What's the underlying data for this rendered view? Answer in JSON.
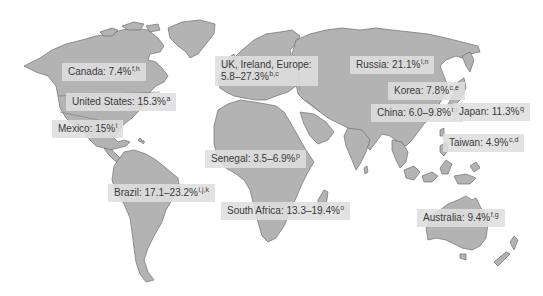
{
  "map": {
    "type": "world-map",
    "land_color": "#b3b3b3",
    "outline_color": "#6e6e6e",
    "label_bg": "#dedede",
    "text_color": "#3a3a3a"
  },
  "labels": [
    {
      "id": "canada",
      "text": "Canada: 7.4%",
      "sup": "f,h"
    },
    {
      "id": "united-states",
      "text": "United States: 15.3%",
      "sup": "a"
    },
    {
      "id": "mexico",
      "text": "Mexico: 15%",
      "sup": "i"
    },
    {
      "id": "uk-europe",
      "text": "UK, Ireland, Europe:",
      "text2": "5.8–27.3%",
      "sup": "b,c"
    },
    {
      "id": "russia",
      "text": "Russia: 21.1%",
      "sup": "l,n"
    },
    {
      "id": "korea",
      "text": "Korea: 7.8%",
      "sup": "c,e"
    },
    {
      "id": "china",
      "text": "China: 6.0–9.8%",
      "sup": "m"
    },
    {
      "id": "japan",
      "text": "Japan: 11.3%",
      "sup": "q"
    },
    {
      "id": "taiwan",
      "text": "Taiwan: 4.9%",
      "sup": "c,d"
    },
    {
      "id": "senegal",
      "text": "Senegal: 3.5–6.9%",
      "sup": "p"
    },
    {
      "id": "brazil",
      "text": "Brazil: 17.1–23.2%",
      "sup": "i,j,k"
    },
    {
      "id": "south-africa",
      "text": "South Africa: 13.3–19.4%",
      "sup": "o"
    },
    {
      "id": "australia",
      "text": "Australia: 9.4%",
      "sup": "f,g"
    }
  ]
}
